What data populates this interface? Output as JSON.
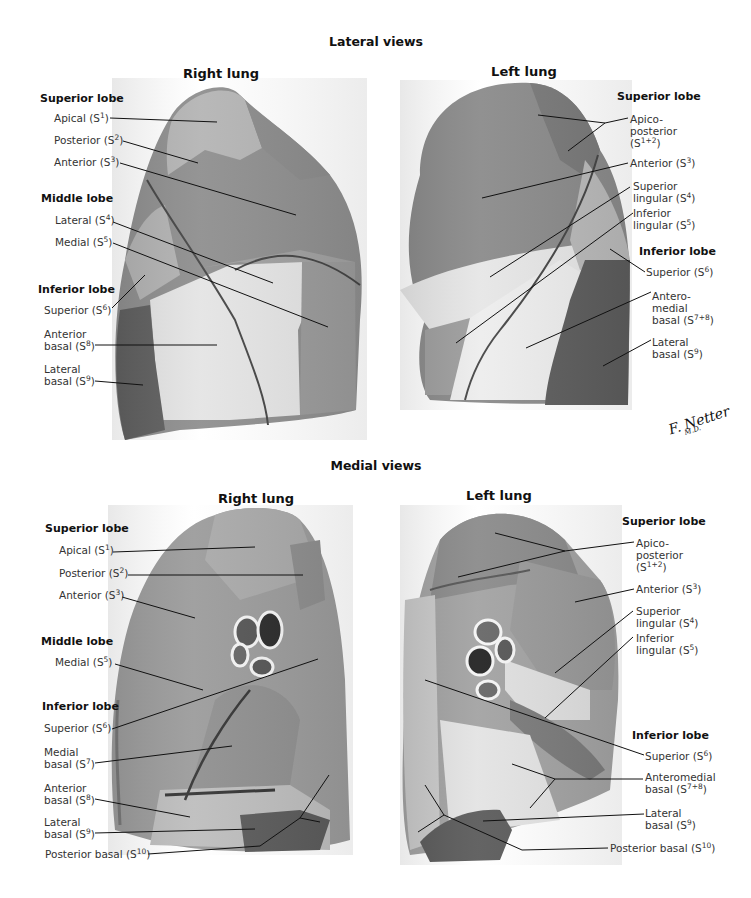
{
  "colors": {
    "background": "#ffffff",
    "segment_dark": "#5e5e5e",
    "segment_mid": "#8c8c8c",
    "segment_light": "#b5b5b5",
    "segment_pale": "#e2e2e2",
    "leader_line": "#111111"
  },
  "lateral": {
    "title": "Lateral views",
    "right": {
      "title": "Right lung",
      "superior_lobe": "Superior lobe",
      "apical": "Apical (S",
      "apical_sup": "1",
      "posterior": "Posterior (S",
      "posterior_sup": "2",
      "anterior": "Anterior (S",
      "anterior_sup": "3",
      "middle_lobe": "Middle lobe",
      "lateral": "Lateral (S",
      "lateral_sup": "4",
      "medial": "Medial (S",
      "medial_sup": "5",
      "inferior_lobe": "Inferior lobe",
      "superior": "Superior (S",
      "superior_sup": "6",
      "anterior_basal_1": "Anterior",
      "anterior_basal_2": "basal (S",
      "anterior_basal_sup": "8",
      "lateral_basal_1": "Lateral",
      "lateral_basal_2": "basal (S",
      "lateral_basal_sup": "9"
    },
    "left": {
      "title": "Left lung",
      "superior_lobe": "Superior lobe",
      "apicoposterior_1": "Apico-",
      "apicoposterior_2": "posterior",
      "apicoposterior_3": "(S",
      "apicoposterior_sup": "1+2",
      "anterior": "Anterior (S",
      "anterior_sup": "3",
      "sup_lingular_1": "Superior",
      "sup_lingular_2": "lingular (S",
      "sup_lingular_sup": "4",
      "inf_lingular_1": "Inferior",
      "inf_lingular_2": "lingular (S",
      "inf_lingular_sup": "5",
      "inferior_lobe": "Inferior lobe",
      "superior": "Superior (S",
      "superior_sup": "6",
      "anteromedial_1": "Antero-",
      "anteromedial_2": "medial",
      "anteromedial_3": "basal (S",
      "anteromedial_sup": "7+8",
      "lateral_basal_1": "Lateral",
      "lateral_basal_2": "basal (S",
      "lateral_basal_sup": "9"
    }
  },
  "medial": {
    "title": "Medial views",
    "right": {
      "title": "Right lung",
      "superior_lobe": "Superior lobe",
      "apical": "Apical (S",
      "apical_sup": "1",
      "posterior": "Posterior (S",
      "posterior_sup": "2",
      "anterior": "Anterior (S",
      "anterior_sup": "3",
      "middle_lobe": "Middle lobe",
      "medial": "Medial (S",
      "medial_sup": "5",
      "inferior_lobe": "Inferior lobe",
      "superior": "Superior (S",
      "superior_sup": "6",
      "medial_basal_1": "Medial",
      "medial_basal_2": "basal (S",
      "medial_basal_sup": "7",
      "anterior_basal_1": "Anterior",
      "anterior_basal_2": "basal (S",
      "anterior_basal_sup": "8",
      "lateral_basal_1": "Lateral",
      "lateral_basal_2": "basal (S",
      "lateral_basal_sup": "9",
      "posterior_basal": "Posterior basal (S",
      "posterior_basal_sup": "10"
    },
    "left": {
      "title": "Left lung",
      "superior_lobe": "Superior lobe",
      "apicoposterior_1": "Apico-",
      "apicoposterior_2": "posterior",
      "apicoposterior_3": "(S",
      "apicoposterior_sup": "1+2",
      "anterior": "Anterior (S",
      "anterior_sup": "3",
      "sup_lingular_1": "Superior",
      "sup_lingular_2": "lingular (S",
      "sup_lingular_sup": "4",
      "inf_lingular_1": "Inferior",
      "inf_lingular_2": "lingular (S",
      "inf_lingular_sup": "5",
      "inferior_lobe": "Inferior lobe",
      "superior": "Superior (S",
      "superior_sup": "6",
      "anteromedial_1": "Anteromedial",
      "anteromedial_2": "basal (S",
      "anteromedial_sup": "7+8",
      "lateral_basal_1": "Lateral",
      "lateral_basal_2": "basal (S",
      "lateral_basal_sup": "9",
      "posterior_basal": "Posterior basal (S",
      "posterior_basal_sup": "10"
    }
  },
  "signature": {
    "name": "F. Netter",
    "suffix": "M.D."
  }
}
